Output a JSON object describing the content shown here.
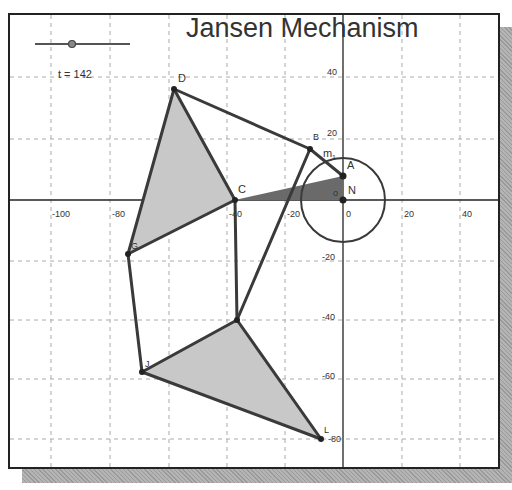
{
  "title": "Jansen Mechanism",
  "slider": {
    "label": "t = 142",
    "value": 142,
    "min": 0,
    "max": 360
  },
  "axes": {
    "x_ticks": [
      -100,
      -80,
      -60,
      -40,
      -20,
      0,
      20,
      40
    ],
    "y_ticks": [
      40,
      20,
      0,
      -20,
      -40,
      -60,
      -80
    ],
    "x_tick_labels": [
      "-100",
      "-80",
      "-60",
      "-40",
      "-20",
      "0",
      "20",
      "40"
    ],
    "y_tick_labels": [
      "40",
      "20",
      "0",
      "-20",
      "-40",
      "-60",
      "-80"
    ]
  },
  "points": {
    "D": {
      "label": "D",
      "x": -57.6,
      "y": 37.6
    },
    "G": {
      "label": "G",
      "x": -73.4,
      "y": -18.4
    },
    "C": {
      "label": "C",
      "x": -37.5,
      "y": 0
    },
    "B": {
      "label": "B",
      "x": -11.3,
      "y": 17.4
    },
    "A": {
      "label": "A",
      "x": 0,
      "y": 8.2
    },
    "N": {
      "label": "N",
      "x": 0,
      "y": 0
    },
    "K": {
      "label": "",
      "x": -36.9,
      "y": -40.9
    },
    "J": {
      "label": "J",
      "x": -68.6,
      "y": -58.7
    },
    "L": {
      "label": "L",
      "x": -7.5,
      "y": -81.5
    }
  },
  "labels": {
    "m1": "m",
    "m1_sub": "1",
    "origin_o": "o"
  },
  "circle": {
    "center": "N",
    "radius": 14.3
  },
  "colors": {
    "line": "#3a3a3a",
    "fill_light": "#c8c8c8",
    "fill_dark": "#6a6a6a",
    "grid": "#aaaaaa"
  }
}
